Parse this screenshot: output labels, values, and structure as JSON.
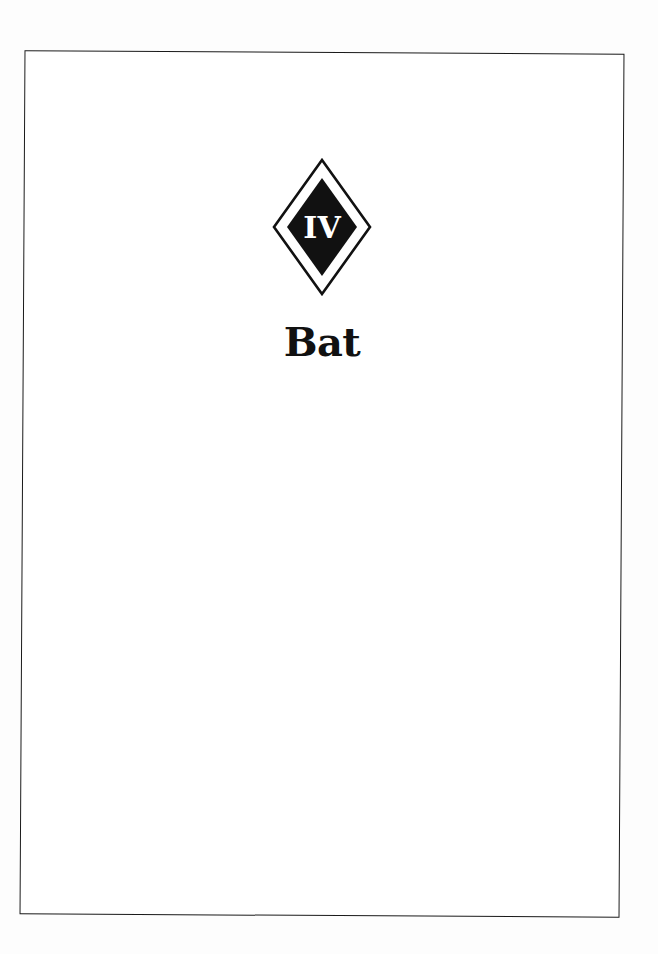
{
  "page": {
    "chapter_numeral": "IV",
    "chapter_title": "Bat",
    "emblem_icon": "diamond-emblem-icon",
    "colors": {
      "ink": "#111111",
      "paper": "#ffffff"
    }
  }
}
